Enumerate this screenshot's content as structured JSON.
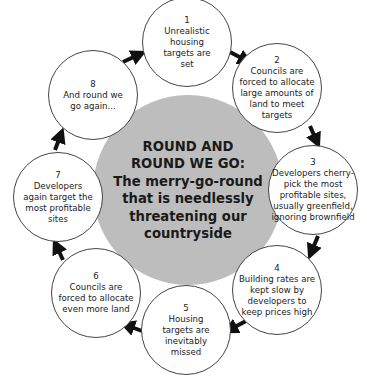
{
  "center": {
    "title_line1": "ROUND AND",
    "title_line2": "ROUND WE GO:",
    "subtitle_line1": "The merry-go-round",
    "subtitle_line2": "that is needlessly",
    "subtitle_line3": "threatening our",
    "subtitle_line4": "countryside",
    "color": "#bdbdbd"
  },
  "steps": [
    {
      "num": "1",
      "text": "Unrealistic housing targets are set"
    },
    {
      "num": "2",
      "text": "Councils are forced to allocate large amounts of land to meet targets"
    },
    {
      "num": "3",
      "text": "Developers cherry-pick the most profitable sites, usually greenfield, ignoring brownfield"
    },
    {
      "num": "4",
      "text": "Building rates are kept slow by developers to keep prices high"
    },
    {
      "num": "5",
      "text": "Housing targets are inevitably missed"
    },
    {
      "num": "6",
      "text": "Councils are forced to allocate even more land"
    },
    {
      "num": "7",
      "text": "Developers again target the most profitable sites"
    },
    {
      "num": "8",
      "text": "And round we go again..."
    }
  ],
  "arrow_color": "#111111"
}
